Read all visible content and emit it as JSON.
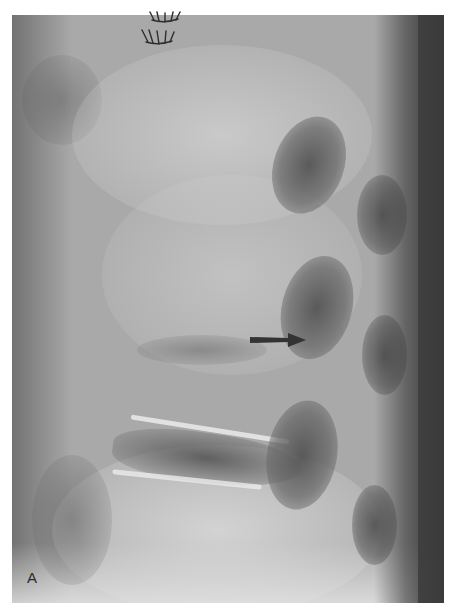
{
  "figure": {
    "type": "lateral lumbar spine radiograph",
    "panel_label": "A",
    "annotations": [
      {
        "type": "arrow",
        "direction": "right",
        "color": "#333333"
      }
    ],
    "surgical_staples": true,
    "colors": {
      "background": "#ffffff",
      "film_base": "#a9a9a9",
      "dark_soft_tissue": "#3c3c3c",
      "bone_highlight": "#e1e1e1"
    }
  }
}
